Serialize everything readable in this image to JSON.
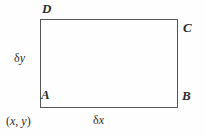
{
  "figure": {
    "name": "rectangle-element-diagram",
    "background_color": "#fefefe",
    "line_color": "#555555"
  },
  "vertices": {
    "top_left": "D",
    "top_right": "C",
    "bottom_left": "A",
    "bottom_right": "B"
  },
  "labels": {
    "delta_y": "δy",
    "delta_x": "δx",
    "origin_point": "(x, y)"
  },
  "delta_y_parts": {
    "symbol": "δ",
    "variable": "y"
  },
  "delta_x_parts": {
    "symbol": "δ",
    "variable": "x"
  },
  "origin_parts": {
    "open": "(",
    "x": "x",
    "separator": ", ",
    "y": "y",
    "close": ")"
  }
}
